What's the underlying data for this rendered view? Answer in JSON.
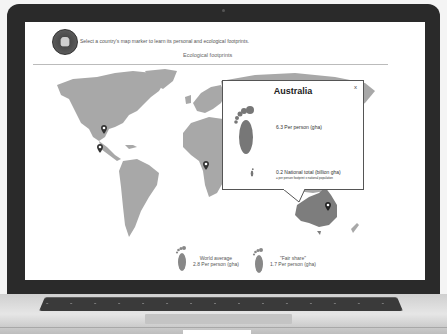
{
  "page": {
    "instruction": "Select a country's map marker to learn its personal and ecological footprints.",
    "section_title": "Ecological footprints",
    "logo": "elephant-badge-logo"
  },
  "map": {
    "markers": [
      {
        "country": "United States",
        "icon": "map-pin-icon"
      },
      {
        "country": "Mexico",
        "icon": "map-pin-icon"
      },
      {
        "country": "Nigeria",
        "icon": "map-pin-icon"
      },
      {
        "country": "Australia",
        "icon": "map-pin-icon",
        "selected": true
      }
    ]
  },
  "popup": {
    "title": "Australia",
    "close_label": "x",
    "per_person": "6.3 Per person (gha)",
    "national_total": "0.2 National total (billion gha)",
    "national_formula": "= per person footprint x national population"
  },
  "legend": {
    "world_average": {
      "label": "World average",
      "value": "2.8 Per person (gha)"
    },
    "fair_share": {
      "label": "\"Fair share\"",
      "value": "1.7 Per person (gha)"
    }
  },
  "colors": {
    "land": "#a8a8a8",
    "selected_land": "#7d7d7d",
    "marker": "#333333",
    "bezel": "#2a2a2a"
  }
}
